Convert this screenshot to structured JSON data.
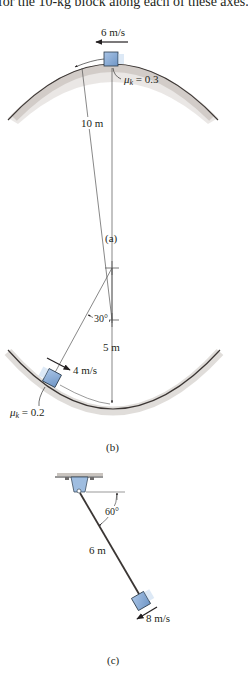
{
  "header_text": "for the 10-kg block along each of these axes.",
  "colors": {
    "block_fill": "#8fb3dc",
    "block_stroke": "#2a3a4a",
    "surface_shade": "#b8b2ad",
    "line": "#231f20"
  },
  "figures": [
    {
      "id": "a",
      "caption": "(a)",
      "speed_label": "6 m/s",
      "friction_label": "μk = 0.3",
      "friction_symbol": "μ",
      "friction_sub": "k",
      "friction_value": " = 0.3",
      "radius_label": "10 m",
      "surface": "convex hump"
    },
    {
      "id": "b",
      "caption": "(b)",
      "speed_label": "4 m/s",
      "friction_symbol": "μ",
      "friction_sub": "k",
      "friction_value": " = 0.2",
      "angle_label": "30°",
      "radius_label": "5 m",
      "surface": "concave bowl"
    },
    {
      "id": "c",
      "caption": "(c)",
      "speed_label": "8 m/s",
      "angle_label": "60°",
      "length_label": "6 m",
      "surface": "pendulum from ceiling pin"
    }
  ]
}
